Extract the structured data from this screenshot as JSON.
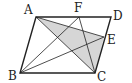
{
  "diagram": {
    "type": "geometry",
    "shape": "parallelogram",
    "colors": {
      "stroke": "#222222",
      "shade": "#d6d6d6",
      "background": "#ffffff"
    },
    "points": {
      "A": {
        "label": "A",
        "x": 36,
        "y": 17,
        "lx": 24,
        "ly": 14
      },
      "D": {
        "label": "D",
        "x": 111,
        "y": 17,
        "lx": 113,
        "ly": 20
      },
      "B": {
        "label": "B",
        "x": 20,
        "y": 73,
        "lx": 8,
        "ly": 80
      },
      "C": {
        "label": "C",
        "x": 95,
        "y": 73,
        "lx": 97,
        "ly": 81
      },
      "F": {
        "label": "F",
        "x": 79,
        "y": 17,
        "lx": 74,
        "ly": 12
      },
      "E": {
        "label": "E",
        "x": 104,
        "y": 37,
        "lx": 107,
        "ly": 44
      }
    },
    "outline": [
      "A",
      "D",
      "C",
      "B"
    ],
    "segments": [
      [
        "A",
        "C"
      ],
      [
        "A",
        "E"
      ],
      [
        "B",
        "F"
      ],
      [
        "B",
        "E"
      ],
      [
        "F",
        "C"
      ]
    ],
    "shaded_region": [
      "A",
      "E",
      "C"
    ]
  }
}
